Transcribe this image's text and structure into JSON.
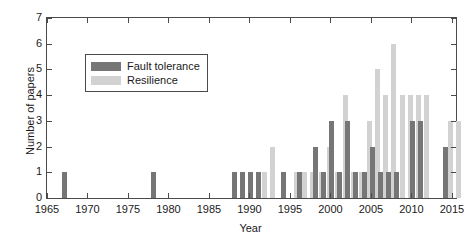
{
  "chart_data": {
    "type": "bar",
    "title": "",
    "subtitle": "",
    "xlabel": "Year",
    "ylabel": "Number of papers",
    "xlim": [
      1965,
      2015.5
    ],
    "ylim": [
      0,
      7
    ],
    "yticks": [
      0,
      1,
      2,
      3,
      4,
      5,
      6,
      7
    ],
    "xticks": [
      1965,
      1970,
      1975,
      1980,
      1985,
      1990,
      1995,
      2000,
      2005,
      2010,
      2015
    ],
    "grid": false,
    "stacked": false,
    "legend_position": "upper left inside",
    "colors": {
      "fault_tolerance": "#767676",
      "resilience": "#d2d2d2",
      "axis": "#4a4a4a",
      "text": "#1a1a1a",
      "background": "#ffffff"
    },
    "categories": [
      1967,
      1978,
      1988,
      1989,
      1990,
      1991,
      1992,
      1994,
      1995,
      1996,
      1997,
      1998,
      1999,
      2000,
      2001,
      2002,
      2003,
      2004,
      2005,
      2006,
      2007,
      2008,
      2009,
      2010,
      2011,
      2012,
      2013,
      2014,
      2015
    ],
    "series": [
      {
        "name": "Fault tolerance",
        "key": "fault_tolerance",
        "values": [
          1,
          1,
          1,
          1,
          1,
          1,
          0,
          1,
          0,
          1,
          0,
          2,
          1,
          3,
          1,
          3,
          1,
          1,
          2,
          1,
          1,
          1,
          0,
          3,
          3,
          0,
          0,
          2,
          0
        ]
      },
      {
        "name": "Resilience",
        "key": "resilience",
        "values": [
          0,
          0,
          0,
          0,
          0,
          1,
          2,
          0,
          1,
          1,
          1,
          1,
          2,
          1,
          4,
          1,
          1,
          3,
          5,
          4,
          6,
          4,
          4,
          4,
          4,
          0,
          0,
          3,
          3
        ]
      }
    ]
  },
  "axes": {
    "y_title": "Number of papers",
    "x_title": "Year",
    "y_tick_labels": [
      "0",
      "1",
      "2",
      "3",
      "4",
      "5",
      "6",
      "7"
    ],
    "x_tick_labels": [
      "1965",
      "1970",
      "1975",
      "1980",
      "1985",
      "1990",
      "1995",
      "2000",
      "2005",
      "2010",
      "2015"
    ]
  },
  "legend": {
    "items": [
      {
        "label": "Fault tolerance",
        "color": "#767676"
      },
      {
        "label": "Resilience",
        "color": "#d2d2d2"
      }
    ]
  }
}
